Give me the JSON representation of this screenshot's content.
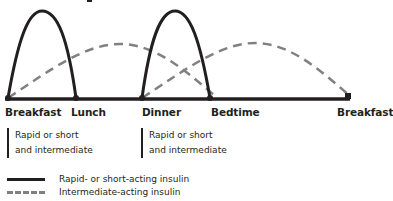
{
  "diagram": {
    "title_fragment": "",
    "timeline": {
      "labels": [
        "Breakfast",
        "Lunch",
        "Dinner",
        "Bedtime",
        "Breakfast"
      ]
    },
    "annotations": [
      {
        "line1": "Rapid or short",
        "line2": "and intermediate"
      },
      {
        "line1": "Rapid or short",
        "line2": "and intermediate"
      }
    ],
    "legend": {
      "items": [
        {
          "label": "Rapid- or short-acting insulin",
          "style": "solid",
          "color": "#231f20"
        },
        {
          "label": "Intermediate-acting insulin",
          "style": "dashed",
          "color": "#808080"
        }
      ]
    },
    "colors": {
      "solid_curve": "#231f20",
      "dashed_curve": "#808080",
      "axis": "#231f20"
    }
  }
}
